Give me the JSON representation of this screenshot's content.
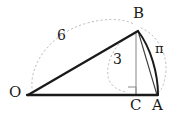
{
  "figure": {
    "type": "geometry-diagram",
    "background_color": "#ffffff",
    "stroke_color": "#1a1a1a",
    "light_stroke_color": "#9a9a9a",
    "dotted_color": "#b0b0b0",
    "vertices": [
      {
        "id": "O",
        "label": "O",
        "x": 28,
        "y": 95,
        "label_x": 9,
        "label_y": 87
      },
      {
        "id": "B",
        "label": "B",
        "x": 138,
        "y": 31,
        "label_x": 133,
        "label_y": 8
      },
      {
        "id": "C",
        "label": "C",
        "x": 136,
        "y": 95,
        "label_x": 131,
        "label_y": 99
      },
      {
        "id": "A",
        "label": "A",
        "x": 157,
        "y": 95,
        "label_x": 153,
        "label_y": 99
      }
    ],
    "measures": [
      {
        "id": "OB",
        "label": "6",
        "label_x": 58,
        "label_y": 31
      },
      {
        "id": "BC",
        "label": "3",
        "label_x": 114,
        "label_y": 54
      },
      {
        "id": "arcBA",
        "label": "π",
        "label_x": 156,
        "label_y": 44
      }
    ],
    "segments": [
      {
        "id": "OA",
        "from": "O",
        "to": "A",
        "weight": "heavy"
      },
      {
        "id": "OB",
        "from": "O",
        "to": "B",
        "weight": "heavy"
      },
      {
        "id": "BA",
        "from": "B",
        "to": "A",
        "weight": "light"
      },
      {
        "id": "BC",
        "from": "B",
        "to": "C",
        "weight": "light"
      }
    ],
    "arcs": [
      {
        "id": "arc-B-A",
        "from": "B",
        "to": "A",
        "weight": "heavy",
        "style": "solid"
      }
    ],
    "right_angle": {
      "at": "C",
      "size": 8
    },
    "leader_arcs": [
      {
        "id": "leader-6",
        "for": "6"
      },
      {
        "id": "leader-3",
        "for": "3"
      },
      {
        "id": "leader-pi",
        "for": "π"
      }
    ]
  }
}
